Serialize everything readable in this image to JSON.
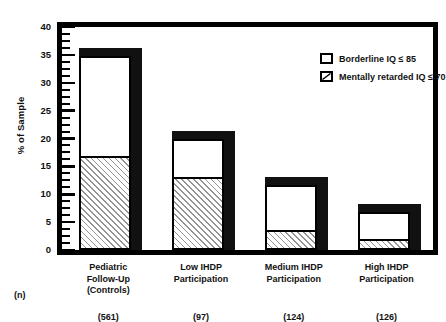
{
  "chart_data": {
    "type": "bar",
    "subtype": "stacked-bar",
    "title": "",
    "xlabel": "",
    "ylabel": "% of Sample",
    "ylim": [
      0,
      40
    ],
    "ytick_labels": [
      "0",
      "5",
      "10",
      "15",
      "20",
      "25",
      "30",
      "35",
      "40"
    ],
    "ytick_values": [
      0,
      5,
      10,
      15,
      20,
      25,
      30,
      35,
      40
    ],
    "minor_tick_step": 1.25,
    "grid": false,
    "legend_position": "top-right",
    "categories": [
      "Pediatric Follow-Up (Controls)",
      "Low IHDP Participation",
      "Medium IHDP Participation",
      "High IHDP Participation"
    ],
    "category_lines": [
      [
        "Pediatric",
        "Follow-Up",
        "(Controls)"
      ],
      [
        "Low IHDP",
        "Participation"
      ],
      [
        "Medium IHDP",
        "Participation"
      ],
      [
        "High IHDP",
        "Participation"
      ]
    ],
    "sample_sizes": [
      "(561)",
      "(97)",
      "(124)",
      "(126)"
    ],
    "sample_size_header": "(n)",
    "series": [
      {
        "name": "Mentally retarded IQ ≤ 70",
        "fill": "hatched",
        "values": [
          16.5,
          12.8,
          3.3,
          1.6
        ]
      },
      {
        "name": "Borderline IQ ≤ 85",
        "fill": "white",
        "values": [
          18.3,
          7.2,
          8.4,
          5.2
        ]
      }
    ],
    "totals": [
      34.8,
      20.0,
      11.7,
      6.8
    ]
  },
  "legend": {
    "items": [
      {
        "label": "Borderline IQ ≤ 85",
        "swatch": "white-box"
      },
      {
        "label": "Mentally retarded IQ ≤ 70",
        "swatch": "hatched-box"
      }
    ]
  },
  "colors": {
    "frame": "#000000",
    "bar_fill": "#ffffff",
    "bar_shadow": "#111111",
    "hatch": "#3c3c3c",
    "background": "#ffffff"
  }
}
